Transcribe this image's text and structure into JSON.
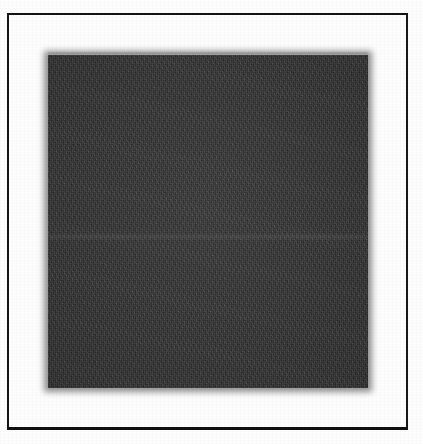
{
  "document": {
    "type": "scanned-page",
    "caption": "",
    "page_background_color": "#fdfdfd",
    "width_px": 423,
    "height_px": 444
  },
  "border_frame": {
    "name": "page-rule-border",
    "color": "#141414",
    "left_px": 7,
    "top_px": 13,
    "width_px": 401,
    "height_px": 417,
    "top_thickness_px": 2,
    "left_thickness_px": 2,
    "right_thickness_px": 2,
    "bottom_thickness_px": 3
  },
  "image_plate": {
    "name": "dark-square-plate",
    "description": "Large uniformly dark grainy square occupying the centre of the framed page",
    "fill_color": "#343434",
    "left_px": 48,
    "top_px": 55,
    "width_px": 320,
    "height_px": 333,
    "edge_softness": "blurred",
    "texture": "halftone-grain",
    "seam_y_px": 237
  },
  "margins": {
    "top_label": "",
    "bottom_label": "",
    "left_label": "",
    "right_label": ""
  }
}
